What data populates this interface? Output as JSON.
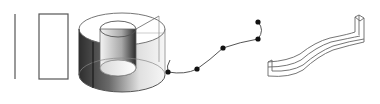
{
  "diagram": {
    "colors": {
      "background": "#ffffff",
      "stroke": "#555555",
      "dark_shade": "#3a3a3a",
      "point": "#111111"
    },
    "elements": [
      {
        "id": "line",
        "type": "line",
        "label": "profile-line"
      },
      {
        "id": "rect",
        "type": "rectangle",
        "label": "profile-rectangle"
      },
      {
        "id": "ring",
        "type": "revolved-solid",
        "label": "ring-solid"
      },
      {
        "id": "spline",
        "type": "spline-path",
        "label": "spline-path",
        "control_points": [
          [
            168,
            72
          ],
          [
            197,
            69
          ],
          [
            223,
            48
          ],
          [
            258,
            39
          ],
          [
            258,
            22
          ]
        ]
      },
      {
        "id": "sweep",
        "type": "swept-solid",
        "label": "swept-solid"
      }
    ]
  }
}
